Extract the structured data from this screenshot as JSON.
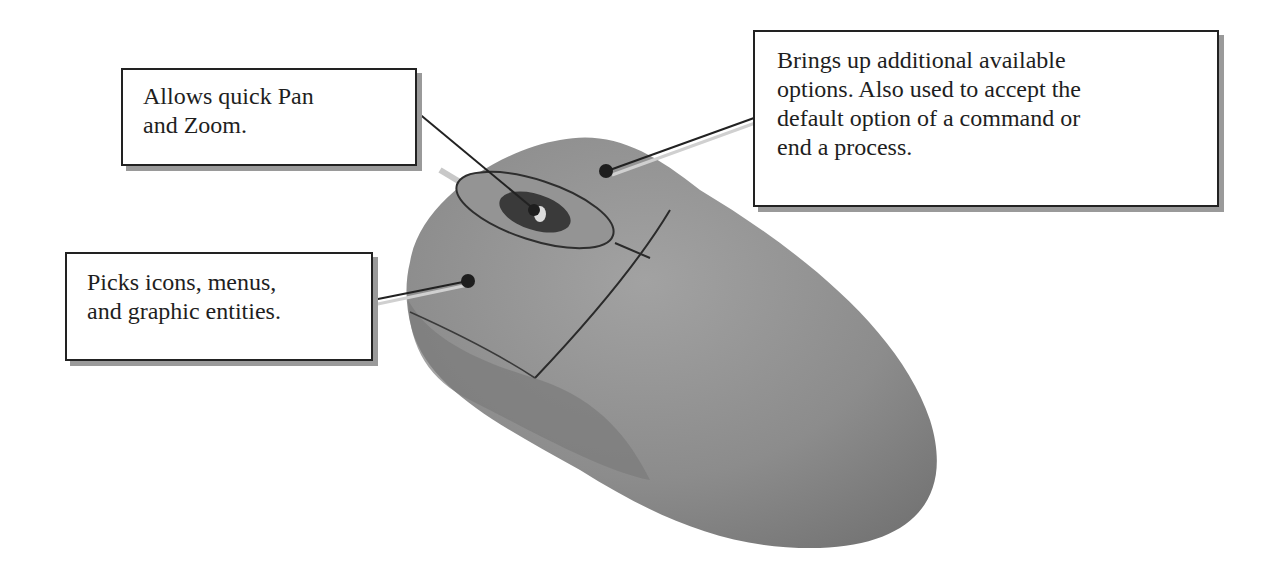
{
  "figure": {
    "colors": {
      "mouse_body": "#8f8f8f",
      "mouse_shadow": "#6e6e6e",
      "wheel": "#3a3a3a",
      "leader_line": "#222222",
      "callout_border": "#222222",
      "callout_shadow": "#9a9a9a"
    }
  },
  "callouts": {
    "middle_button": {
      "lines": [
        "Allows quick Pan",
        "and Zoom."
      ]
    },
    "right_button": {
      "lines": [
        "Brings up additional available",
        "options. Also used to accept the",
        "default option of a command or",
        "end a process."
      ]
    },
    "left_button": {
      "lines": [
        "Picks icons, menus,",
        "and graphic entities."
      ]
    }
  }
}
